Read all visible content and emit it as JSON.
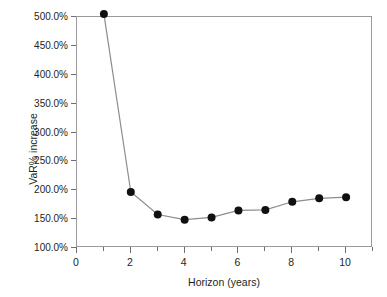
{
  "chart_data": {
    "type": "line",
    "title": "",
    "xlabel": "Horizon (years)",
    "ylabel": "VaR% increase",
    "x": [
      1,
      2,
      3,
      4,
      5,
      6,
      7,
      8,
      9,
      10
    ],
    "values": [
      505.0,
      197.0,
      158.0,
      149.0,
      153.0,
      165.0,
      166.0,
      180.0,
      186.0,
      188.0
    ],
    "series": [
      {
        "name": "VaR% increase",
        "values": [
          505.0,
          197.0,
          158.0,
          149.0,
          153.0,
          165.0,
          166.0,
          180.0,
          186.0,
          188.0
        ]
      }
    ],
    "xlim": [
      0,
      11
    ],
    "ylim": [
      100,
      500
    ],
    "y_ticks": [
      100,
      150,
      200,
      250,
      300,
      350,
      400,
      450,
      500
    ],
    "y_tick_labels": [
      "100.0%",
      "150.0%",
      "200.0%",
      "250.0%",
      "300.0%",
      "350.0%",
      "400.0%",
      "450.0%",
      "500.0%"
    ],
    "x_ticks_major": [
      0,
      2,
      4,
      6,
      8,
      10
    ],
    "x_tick_labels": [
      "0",
      "2",
      "4",
      "6",
      "8",
      "10"
    ],
    "x_ticks_minor": [
      1,
      3,
      5,
      7,
      9,
      11
    ],
    "grid": false,
    "legend": false,
    "marker": "filled-circle",
    "marker_color": "#101010",
    "line_color": "#8c8c8c",
    "frame_color": "#9a9a9a",
    "background": "#ffffff"
  }
}
